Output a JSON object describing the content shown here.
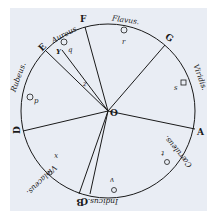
{
  "diagram": {
    "center_label": "O",
    "colors": {
      "paper": "#e9edf4",
      "ink": "#1a1a1a"
    },
    "points": [
      {
        "id": "A",
        "label": "A"
      },
      {
        "id": "B",
        "label": "B"
      },
      {
        "id": "C",
        "label": "C"
      },
      {
        "id": "D",
        "label": "D"
      },
      {
        "id": "E",
        "label": "E"
      },
      {
        "id": "F",
        "label": "F"
      },
      {
        "id": "G",
        "label": "G"
      }
    ],
    "arcs": [
      {
        "name": "Rubeus",
        "label": "Rubeus.",
        "marker": "p"
      },
      {
        "name": "Aureus",
        "label": "Aureus.",
        "marker": "q"
      },
      {
        "name": "Flavus",
        "label": "Flavus.",
        "marker": "r"
      },
      {
        "name": "Viridis",
        "label": "Viridis.",
        "marker": "s"
      },
      {
        "name": "Cæruleus",
        "label": "Cæruleus.",
        "marker": "t"
      },
      {
        "name": "Indicus",
        "label": "Indicus.",
        "marker": "v"
      },
      {
        "name": "Violaceus",
        "label": "Violaceus.",
        "marker": "x"
      }
    ],
    "inner_marks": {
      "Y": "Y",
      "Z": "z"
    }
  }
}
